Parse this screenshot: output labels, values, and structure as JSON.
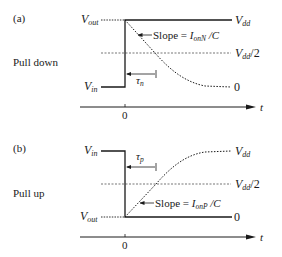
{
  "panels": [
    {
      "id": "a",
      "tag": "(a)",
      "caption": "Pull down",
      "labels": {
        "v_top_left": "V",
        "v_top_left_sub": "out",
        "v_bottom_left": "V",
        "v_bottom_left_sub": "in",
        "v_dd": "V",
        "v_dd_sub": "dd",
        "v_dd_half": "V",
        "v_dd_half_sub": "dd",
        "v_dd_half_suffix": "/2",
        "zero_right": "0",
        "slope_prefix": "Slope = ",
        "slope_I": "I",
        "slope_sub": "onN",
        "slope_suffix": " /C",
        "tau": "τ",
        "tau_sub": "n",
        "t_origin": "0",
        "t_axis": "t"
      }
    },
    {
      "id": "b",
      "tag": "(b)",
      "caption": "Pull up",
      "labels": {
        "v_top_left": "V",
        "v_top_left_sub": "in",
        "v_bottom_left": "V",
        "v_bottom_left_sub": "out",
        "v_dd": "V",
        "v_dd_sub": "dd",
        "v_dd_half": "V",
        "v_dd_half_sub": "dd",
        "v_dd_half_suffix": "/2",
        "zero_right": "0",
        "slope_prefix": "Slope = ",
        "slope_I": "I",
        "slope_sub": "onP",
        "slope_suffix": " /C",
        "tau": "τ",
        "tau_sub": "p",
        "t_origin": "0",
        "t_axis": "t"
      }
    }
  ],
  "colors": {
    "ink": "#1a1a1a",
    "background": "#ffffff"
  }
}
